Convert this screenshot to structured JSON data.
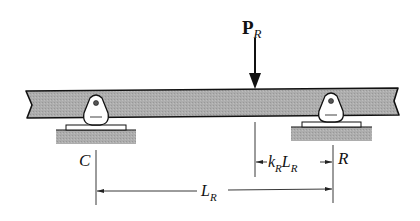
{
  "diagram": {
    "type": "beam-on-supports",
    "load": {
      "symbol": "P",
      "subscript": "R"
    },
    "supports": [
      {
        "id": "left",
        "label": "C"
      },
      {
        "id": "right",
        "label": "R"
      }
    ],
    "dimensions": {
      "span": {
        "symbol": "L",
        "subscript": "R"
      },
      "load_offset": {
        "prefix": "k",
        "prefix_sub": "R",
        "symbol": "L",
        "subscript": "R"
      }
    },
    "colors": {
      "beam_fill": "#a9a9a9",
      "ground_fill": "#a3a3a3",
      "line": "#111111",
      "background": "#ffffff"
    }
  }
}
